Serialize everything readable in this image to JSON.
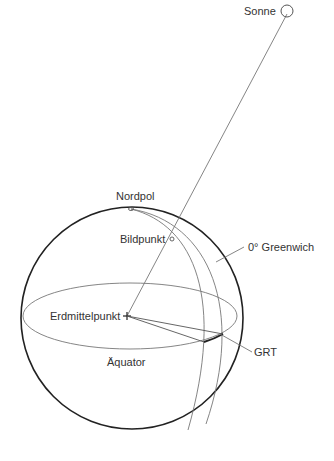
{
  "diagram": {
    "type": "celestial-sphere",
    "labels": {
      "sun": "Sonne",
      "north_pole": "Nordpol",
      "subpoint": "Bildpunkt",
      "meridian": "0° Greenwich",
      "center": "Erdmittelpunkt",
      "grt": "GRT",
      "equator": "Äquator"
    },
    "colors": {
      "outline": "#222222",
      "thin_line": "#777777",
      "text": "#333333"
    }
  }
}
